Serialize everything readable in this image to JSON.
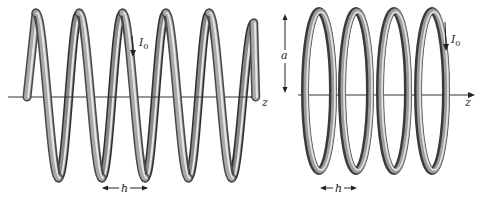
{
  "figure": {
    "left_panel": {
      "name": "helical-coil",
      "turns": 5,
      "labels": {
        "current": "I",
        "current_sub": "0",
        "pitch": "h",
        "axis": "z"
      }
    },
    "right_panel": {
      "name": "ring-stack",
      "rings": 4,
      "labels": {
        "current": "I",
        "current_sub": "0",
        "pitch": "h",
        "radius": "a",
        "axis": "z"
      }
    },
    "colors": {
      "wire_dark": "#3a3a3a",
      "wire_mid": "#8a8a8a",
      "wire_light": "#e6e6e6",
      "axis": "#333333",
      "background": "#ffffff"
    }
  }
}
